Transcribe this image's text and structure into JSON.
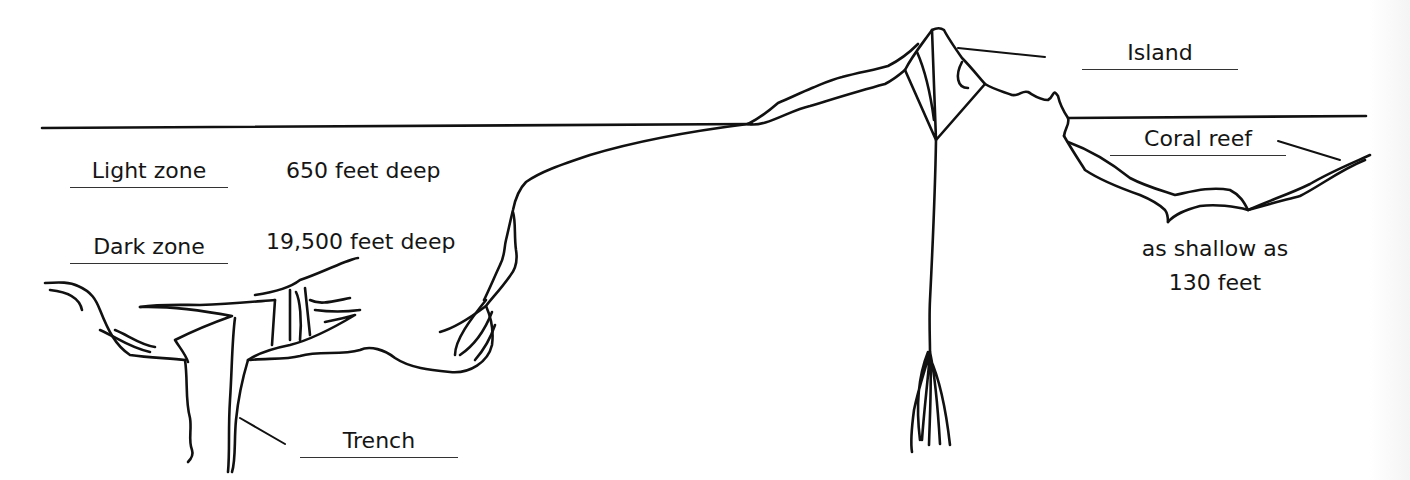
{
  "diagram": {
    "type": "ocean cross-section",
    "labels": {
      "island": "Island",
      "coral_reef": "Coral reef",
      "light_zone": "Light zone",
      "dark_zone": "Dark zone",
      "trench": "Trench"
    },
    "annotations": {
      "light_zone_depth": "650 feet deep",
      "dark_zone_depth": "19,500 feet deep",
      "reef_depth_line1": "as shallow as",
      "reef_depth_line2": "130 feet"
    },
    "colors": {
      "ink": "#111111",
      "background": "#ffffff"
    }
  }
}
